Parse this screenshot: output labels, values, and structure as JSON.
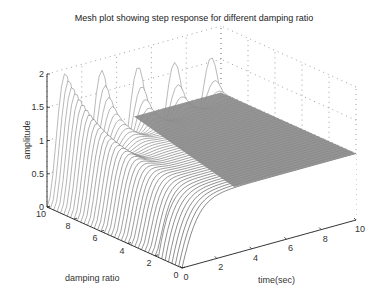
{
  "chart_data": {
    "type": "mesh3d",
    "title": "Mesh plot showing step response for different damping ratio",
    "xlabel": "time(sec)",
    "ylabel": "damping ratio",
    "zlabel": "amplitude",
    "x_ticks": [
      "0",
      "2",
      "4",
      "6",
      "8",
      "10"
    ],
    "y_ticks": [
      "0",
      "2",
      "4",
      "6",
      "8",
      "10"
    ],
    "z_ticks": [
      "0",
      "0.5",
      "1",
      "1.5",
      "2"
    ],
    "xlim": [
      0,
      10
    ],
    "ylim": [
      0,
      10
    ],
    "zlim": [
      0,
      2
    ],
    "grid": true,
    "surface": "step response of 2nd-order system, amplitude vs time and damping-ratio index; oscillatory peaks ~1.9-2.0 at low damping index rows (repeating ridges), settling to 1.0 plateau",
    "peaks": [
      {
        "damping_index": 10,
        "time": 0.3,
        "amplitude": 1.9
      },
      {
        "damping_index": 10,
        "time": 2.4,
        "amplitude": 1.95
      },
      {
        "damping_index": 10,
        "time": 4.5,
        "amplitude": 1.95
      },
      {
        "damping_index": 10,
        "time": 6.5,
        "amplitude": 1.95
      },
      {
        "damping_index": 10,
        "time": 8.5,
        "amplitude": 1.95
      }
    ],
    "steady_state": 1.0
  },
  "figure": {
    "background": "#ffffff",
    "mesh_color_dark": "#404040",
    "plateau_color": "#8a8a8a"
  }
}
